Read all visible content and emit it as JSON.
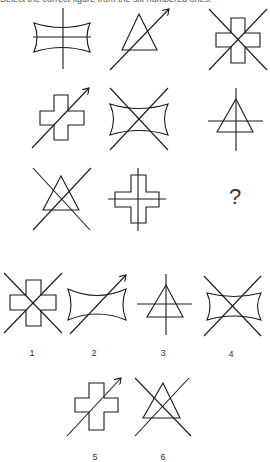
{
  "instruction": "Select the correct figure from the six numbered ones.",
  "puzzle": {
    "grid": [
      [
        {
          "shape": "concave-rectangle",
          "overlay": "plus-lines"
        },
        {
          "shape": "triangle",
          "overlay": "arrow"
        },
        {
          "shape": "cross",
          "overlay": "x-lines"
        }
      ],
      [
        {
          "shape": "cross",
          "overlay": "arrow"
        },
        {
          "shape": "concave-rectangle",
          "overlay": "x-lines"
        },
        {
          "shape": "triangle",
          "overlay": "plus-lines"
        }
      ],
      [
        {
          "shape": "triangle",
          "overlay": "x-lines"
        },
        {
          "shape": "cross",
          "overlay": "plus-lines"
        },
        {
          "shape": "missing",
          "overlay": "none"
        }
      ]
    ],
    "missing_symbol": "?"
  },
  "options": [
    {
      "number": "1",
      "shape": "cross",
      "overlay": "x-lines"
    },
    {
      "number": "2",
      "shape": "concave-rectangle",
      "overlay": "arrow"
    },
    {
      "number": "3",
      "shape": "triangle",
      "overlay": "plus-lines"
    },
    {
      "number": "4",
      "shape": "concave-rectangle",
      "overlay": "x-lines"
    },
    {
      "number": "5",
      "shape": "cross",
      "overlay": "arrow"
    },
    {
      "number": "6",
      "shape": "triangle",
      "overlay": "x-lines"
    }
  ]
}
